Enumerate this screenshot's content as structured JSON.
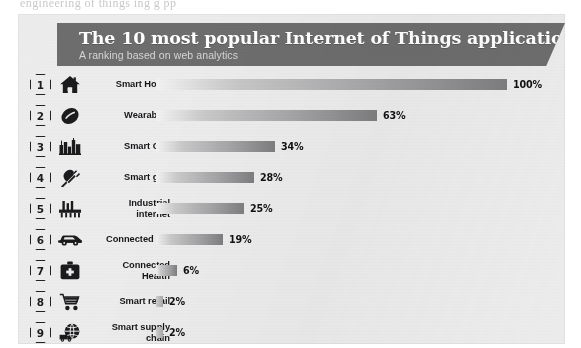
{
  "page": {
    "clipped_top_text": "engineering of things   ing     g      pp"
  },
  "infographic": {
    "title": "The 10 most popular Internet of Things applications",
    "subtitle": "A ranking based on web analytics",
    "colors": {
      "banner": "#6d6d6e",
      "panel": "#ececed",
      "bar_light": "#f2f2f2",
      "bar_dark": "#7e7e80",
      "text": "#17171a"
    }
  },
  "chart_data": {
    "type": "bar",
    "title": "The 10 most popular Internet of Things applications",
    "subtitle": "A ranking based on web analytics",
    "orientation": "horizontal",
    "xlabel": "",
    "ylabel": "",
    "xlim": [
      0,
      100
    ],
    "grid": false,
    "legend": null,
    "value_unit": "%",
    "note": "Ranked 1-10; ranks 1-9 are visible, item 10 is cut off below the visible area.",
    "categories": [
      "Smart Home",
      "Wearables",
      "Smart City",
      "Smart grid",
      "Industrial internet",
      "Connected car",
      "Connected Health",
      "Smart retail",
      "Smart supply chain"
    ],
    "values": [
      100,
      63,
      34,
      28,
      25,
      19,
      6,
      2,
      2
    ],
    "data_labels": [
      "100%",
      "63%",
      "34%",
      "28%",
      "25%",
      "19%",
      "6%",
      "2%",
      "2%"
    ]
  },
  "rows": [
    {
      "rank": "1",
      "icon": "house-icon",
      "label": "Smart Home",
      "label_lines": [
        "Smart Home"
      ],
      "value": 100,
      "pct": "100%"
    },
    {
      "rank": "2",
      "icon": "smartwatch-icon",
      "label": "Wearables",
      "label_lines": [
        "Wearables"
      ],
      "value": 63,
      "pct": "63%"
    },
    {
      "rank": "3",
      "icon": "cityscape-icon",
      "label": "Smart City",
      "label_lines": [
        "Smart City"
      ],
      "value": 34,
      "pct": "34%"
    },
    {
      "rank": "4",
      "icon": "power-plug-icon",
      "label": "Smart grid",
      "label_lines": [
        "Smart grid"
      ],
      "value": 28,
      "pct": "28%"
    },
    {
      "rank": "5",
      "icon": "factory-icon",
      "label": "Industrial internet",
      "label_lines": [
        "Industrial",
        "internet"
      ],
      "value": 25,
      "pct": "25%"
    },
    {
      "rank": "6",
      "icon": "car-icon",
      "label": "Connected car",
      "label_lines": [
        "Connected car"
      ],
      "value": 19,
      "pct": "19%"
    },
    {
      "rank": "7",
      "icon": "medical-bag-icon",
      "label": "Connected Health",
      "label_lines": [
        "Connected",
        "Health"
      ],
      "value": 6,
      "pct": "6%"
    },
    {
      "rank": "8",
      "icon": "shopping-cart-icon",
      "label": "Smart retail",
      "label_lines": [
        "Smart retail"
      ],
      "value": 2,
      "pct": "2%"
    },
    {
      "rank": "9",
      "icon": "globe-truck-icon",
      "label": "Smart supply chain",
      "label_lines": [
        "Smart supply",
        "chain"
      ],
      "value": 2,
      "pct": "2%"
    }
  ]
}
